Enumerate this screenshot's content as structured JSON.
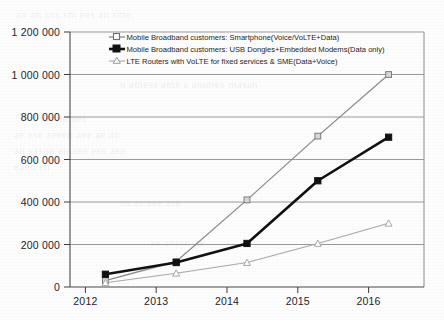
{
  "chart_data": {
    "type": "line",
    "title": "",
    "subtitle": "",
    "xlabel": "",
    "ylabel": "",
    "categories": [
      "2012",
      "2013",
      "2014",
      "2015",
      "2016"
    ],
    "ylim": [
      0,
      1200000
    ],
    "ytick_values": [
      0,
      200000,
      400000,
      600000,
      800000,
      1000000,
      1200000
    ],
    "ytick_labels": [
      "0",
      "200 000",
      "400 000",
      "600 000",
      "800 000",
      "1 000 000",
      "1 200 000"
    ],
    "grid": "horizontal",
    "legend_position": "top-center-inside",
    "series": [
      {
        "name": "Mobile Broadband customers: Smartphone(Voice/VoLTE+Data)",
        "values": [
          30000,
          120000,
          410000,
          710000,
          1000000
        ],
        "color": "#8c8c8c",
        "marker": "square-open",
        "line_width": 1.3
      },
      {
        "name": "Mobile Broadband customers: USB Dongles+Embedded Modems(Data only)",
        "values": [
          60000,
          115000,
          205000,
          500000,
          705000
        ],
        "color": "#111111",
        "marker": "square-filled",
        "line_width": 2.6
      },
      {
        "name": "LTE Routers with VoLTE for fixed services & SME(Data+Voice)",
        "values": [
          20000,
          65000,
          115000,
          205000,
          300000
        ],
        "color": "#a8a8a8",
        "marker": "triangle-open",
        "line_width": 1.1
      }
    ]
  },
  "axes": {
    "y_axis_name": "y-axis",
    "x_axis_name": "x-axis"
  },
  "legend": {
    "entries": [
      "Mobile Broadband customers: Smartphone(Voice/VoLTE+Data)",
      "Mobile Broadband customers: USB Dongles+Embedded Modems(Data only)",
      "LTE Routers with VoLTE for fixed services & SME(Data+Voice)"
    ]
  },
  "background": {
    "paper_color": "#fdfdfd",
    "bleed_through_lines": [
      "an an sns sm ees an sme",
      "n amess ams a ammes masan",
      "the sn aes",
      "ae ese  aeeen  aee ae an",
      "an sasnn en ans esn asn",
      "eaen en",
      "sn as aee ase",
      "ae anesn ae"
    ]
  }
}
